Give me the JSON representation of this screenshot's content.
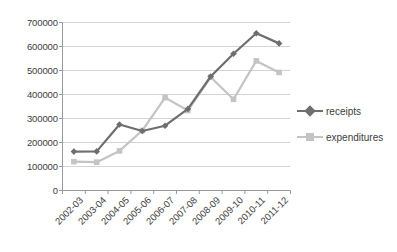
{
  "chart_data": {
    "type": "line",
    "title": "",
    "xlabel": "",
    "ylabel": "",
    "categories": [
      "2002-03",
      "2003-04",
      "2004-05",
      "2005-06",
      "2006-07",
      "2007-08",
      "2008-09",
      "2009-10",
      "2010-11",
      "2011-12"
    ],
    "series": [
      {
        "name": "receipts",
        "color": "#6e6e6e",
        "marker": "diamond",
        "values": [
          162000,
          163000,
          275000,
          248000,
          270000,
          340000,
          475000,
          570000,
          655000,
          613000
        ]
      },
      {
        "name": "expenditures",
        "color": "#c4c4c4",
        "marker": "square",
        "values": [
          120000,
          118000,
          165000,
          250000,
          387000,
          333000,
          472000,
          380000,
          540000,
          492000
        ]
      }
    ],
    "ylim": [
      0,
      700000
    ],
    "yticks": [
      0,
      100000,
      200000,
      300000,
      400000,
      500000,
      600000,
      700000
    ],
    "ytick_labels": [
      "0",
      "100000",
      "200000",
      "300000",
      "400000",
      "500000",
      "600000",
      "700000"
    ],
    "grid": true,
    "grid_axis": "y",
    "legend_position": "right",
    "background_color": "#ffffff",
    "axis_color": "#9b9b9b",
    "grid_color": "#cfcfcf"
  },
  "legend": {
    "items": [
      {
        "label": "receipts"
      },
      {
        "label": "expenditures"
      }
    ]
  }
}
